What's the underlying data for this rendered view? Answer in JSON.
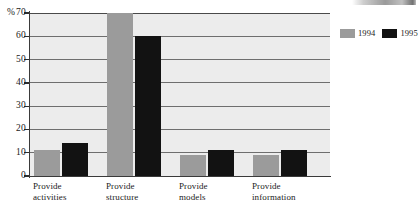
{
  "chart_data": {
    "type": "bar",
    "title": "",
    "xlabel": "",
    "ylabel": "%",
    "ylim": [
      0,
      70
    ],
    "ytick_step": 10,
    "yticks": [
      0,
      10,
      20,
      30,
      40,
      50,
      60,
      70
    ],
    "ytick_labels": [
      "0",
      "10",
      "20",
      "30",
      "40",
      "50",
      "60",
      "70"
    ],
    "axis_unit_prefix": "%",
    "grid": true,
    "grid_axis": "y",
    "legend_position": "right",
    "categories": [
      "Provide\nactivities",
      "Provide\nstructure",
      "Provide\nmodels",
      "Provide\ninformation"
    ],
    "series": [
      {
        "name": "1994",
        "color": "#9b9b9b",
        "values": [
          11,
          70,
          9,
          9
        ]
      },
      {
        "name": "1995",
        "color": "#121212",
        "values": [
          14,
          60,
          11,
          11
        ]
      }
    ]
  },
  "legend": {
    "entries": [
      {
        "label": "1994",
        "swatch": "legend-swatch-1994"
      },
      {
        "label": "1995",
        "swatch": "legend-swatch-1995"
      }
    ]
  },
  "axis": {
    "y_labels": [
      {
        "value": "70",
        "unit": "%"
      },
      {
        "value": "60",
        "unit": ""
      },
      {
        "value": "50",
        "unit": ""
      },
      {
        "value": "40",
        "unit": ""
      },
      {
        "value": "30",
        "unit": ""
      },
      {
        "value": "20",
        "unit": ""
      },
      {
        "value": "10",
        "unit": ""
      },
      {
        "value": "0",
        "unit": ""
      }
    ]
  },
  "colors": {
    "series_1994": "#9b9b9b",
    "series_1995": "#121212",
    "plot_background": "#ececec",
    "gridline": "#6e6e6e",
    "axis": "#3a3a3a",
    "page_background": "#ffffff"
  }
}
